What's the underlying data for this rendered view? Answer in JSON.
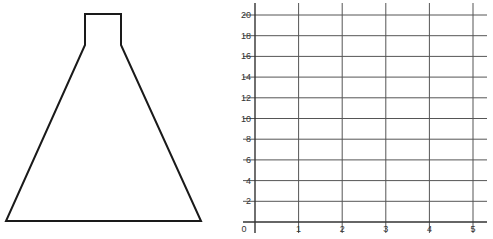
{
  "flask": {
    "label": "flask-outline",
    "stroke_color": "#1a1a1a",
    "points": [
      [
        85,
        14
      ],
      [
        121,
        14
      ],
      [
        121,
        45
      ],
      [
        201,
        221
      ],
      [
        6,
        221
      ],
      [
        85,
        45
      ]
    ]
  },
  "grid": {
    "origin_label": "0",
    "line_color": "#555555",
    "axis_color": "#333333",
    "x_ticks": [
      "1",
      "2",
      "3",
      "4",
      "5"
    ],
    "y_ticks": [
      "2",
      "4",
      "6",
      "8",
      "10",
      "12",
      "14",
      "16",
      "18",
      "20"
    ]
  },
  "chart_data": {
    "type": "line",
    "title": "",
    "xlabel": "",
    "ylabel": "",
    "x_ticks": [
      0,
      1,
      2,
      3,
      4,
      5
    ],
    "y_ticks": [
      0,
      2,
      4,
      6,
      8,
      10,
      12,
      14,
      16,
      18,
      20
    ],
    "xlim": [
      0,
      5
    ],
    "ylim": [
      0,
      20
    ],
    "grid": true,
    "series": []
  }
}
